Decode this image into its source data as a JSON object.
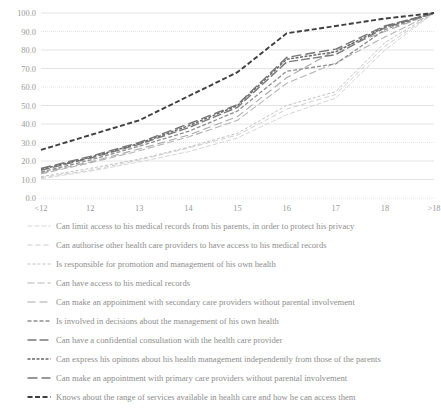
{
  "chart_data": {
    "type": "line",
    "title": "",
    "subtitle": "",
    "xlabel": "",
    "ylabel": "",
    "grid": true,
    "legend_position": "bottom",
    "categories": [
      "<12",
      "12",
      "13",
      "14",
      "15",
      "16",
      "17",
      "18",
      ">18"
    ],
    "x_tick_labels": [
      "<12",
      "12",
      "13",
      "14",
      "15",
      "16",
      "17",
      "18",
      ">18"
    ],
    "y_tick_labels": [
      "0.0",
      "10.0",
      "20.0",
      "30.0",
      "40.0",
      "50.0",
      "60.0",
      "70.0",
      "80.0",
      "90.0",
      "100.0"
    ],
    "ylim": [
      0,
      100
    ],
    "y_tick_step": 10,
    "series": [
      {
        "name": "Can limit access to his medical records from his parents, in order to protect his privacy",
        "dash": "5,2",
        "width": 1.0,
        "color": "#d6d6d6",
        "values": [
          10.5,
          14.5,
          19.5,
          25.0,
          32.5,
          45.0,
          54.0,
          80.0,
          100.0
        ]
      },
      {
        "name": "Can authorise other health care providers to have access to his medical records",
        "dash": "5,3",
        "width": 1.0,
        "color": "#cfcfcf",
        "values": [
          11.0,
          15.0,
          20.5,
          27.0,
          34.0,
          48.0,
          56.0,
          82.0,
          100.0
        ]
      },
      {
        "name": "Is responsible for promotion and management of his own health",
        "dash": "3,2",
        "width": 1.0,
        "color": "#c2c2c2",
        "values": [
          11.5,
          16.0,
          21.0,
          27.5,
          35.0,
          50.0,
          57.5,
          84.0,
          100.0
        ]
      },
      {
        "name": "Can have access to his medical records",
        "dash": "7,3",
        "width": 1.1,
        "color": "#b5b5b5",
        "values": [
          13.0,
          19.0,
          25.5,
          33.0,
          42.0,
          62.0,
          73.0,
          87.0,
          100.0
        ]
      },
      {
        "name": "Can make an appointment with secondary care providers without parental involvement",
        "dash": "8,4",
        "width": 1.1,
        "color": "#aaaaaa",
        "values": [
          13.5,
          19.5,
          26.5,
          34.0,
          44.0,
          65.0,
          80.0,
          90.0,
          100.0
        ]
      },
      {
        "name": "Is involved in decisions about the management of his own health",
        "dash": "4,2",
        "width": 1.3,
        "color": "#8f8f8f",
        "values": [
          14.0,
          20.5,
          28.0,
          36.0,
          47.0,
          68.5,
          72.5,
          91.0,
          100.0
        ]
      },
      {
        "name": "Can have a confidential consultation with the health care provider",
        "dash": "9,3",
        "width": 1.4,
        "color": "#7a7a7a",
        "values": [
          15.0,
          21.5,
          29.0,
          38.0,
          49.0,
          73.5,
          77.5,
          92.0,
          100.0
        ]
      },
      {
        "name": "Can express his opinons about his health management independently from those of the parents",
        "dash": "3,1.5",
        "width": 1.5,
        "color": "#6a6a6a",
        "values": [
          15.5,
          22.0,
          29.5,
          39.0,
          50.0,
          75.0,
          79.0,
          92.5,
          100.0
        ]
      },
      {
        "name": "Can make an appointment with primary care providers without parental involvement",
        "dash": "10,4",
        "width": 1.4,
        "color": "#757575",
        "values": [
          16.0,
          22.5,
          30.0,
          40.0,
          50.5,
          76.0,
          80.5,
          93.0,
          100.0
        ]
      },
      {
        "name": "Knows about the range of services available in health care and how he can access them",
        "dash": "5,2.5",
        "width": 1.9,
        "color": "#3f3f3f",
        "values": [
          26.0,
          34.0,
          42.0,
          55.0,
          68.0,
          89.0,
          93.0,
          97.0,
          100.0
        ]
      }
    ]
  },
  "caption": {
    "text": ""
  }
}
